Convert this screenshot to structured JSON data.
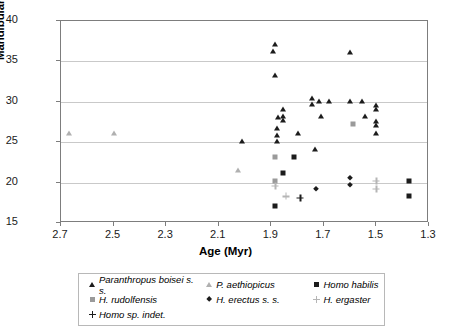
{
  "chart_data": {
    "type": "scatter",
    "title": "",
    "xlabel": "Age (Myr)",
    "ylabel": "Mandibular corpus breadth (mm)",
    "xlim": [
      2.7,
      1.3
    ],
    "ylim": [
      15,
      40
    ],
    "x_reversed": true,
    "xticks": [
      "2.7",
      "2.5",
      "2.3",
      "2.1",
      "1.9",
      "1.7",
      "1.5",
      "1.3"
    ],
    "xtick_values": [
      2.7,
      2.5,
      2.3,
      2.1,
      1.9,
      1.7,
      1.5,
      1.3
    ],
    "yticks": [
      "15",
      "20",
      "25",
      "30",
      "35",
      "40"
    ],
    "ytick_values": [
      15,
      20,
      25,
      30,
      35,
      40
    ],
    "grid": "horizontal",
    "legend_position": "below-plot",
    "series": [
      {
        "name": "Paranthropus boisei s. s.",
        "marker": "triangle",
        "color": "#1c1c1c",
        "points": [
          [
            1.885,
            37.2
          ],
          [
            1.895,
            36.3
          ],
          [
            1.885,
            33.3
          ],
          [
            1.875,
            28.1
          ],
          [
            1.855,
            29.1
          ],
          [
            1.855,
            28.3
          ],
          [
            1.855,
            27.7
          ],
          [
            1.88,
            26.7
          ],
          [
            1.88,
            25.9
          ],
          [
            1.88,
            25.1
          ],
          [
            2.01,
            25.1
          ],
          [
            1.8,
            26.1
          ],
          [
            1.745,
            30.5
          ],
          [
            1.745,
            29.7
          ],
          [
            1.72,
            30.1
          ],
          [
            1.68,
            30.1
          ],
          [
            1.6,
            30.1
          ],
          [
            1.555,
            30.1
          ],
          [
            1.6,
            36.2
          ],
          [
            1.71,
            28.2
          ],
          [
            1.545,
            28.2
          ],
          [
            1.5,
            29.6
          ],
          [
            1.5,
            29.1
          ],
          [
            1.5,
            27.6
          ],
          [
            1.5,
            27.1
          ],
          [
            1.5,
            26.2
          ],
          [
            1.735,
            24.1
          ]
        ]
      },
      {
        "name": "P. aethiopicus",
        "marker": "triangle",
        "color": "#b0b0b0",
        "points": [
          [
            2.67,
            26.1
          ],
          [
            2.5,
            26.2
          ],
          [
            2.025,
            21.6
          ]
        ]
      },
      {
        "name": "Homo habilis",
        "marker": "square",
        "color": "#1c1c1c",
        "points": [
          [
            1.855,
            21.2
          ],
          [
            1.815,
            23.2
          ],
          [
            1.885,
            17.1
          ],
          [
            1.375,
            20.2
          ],
          [
            1.375,
            18.3
          ]
        ]
      },
      {
        "name": "H. rudolfensis",
        "marker": "square",
        "color": "#9a9a9a",
        "points": [
          [
            1.885,
            23.2
          ],
          [
            1.885,
            20.2
          ],
          [
            1.59,
            27.2
          ]
        ]
      },
      {
        "name": "H. erectus s. s.",
        "marker": "diamond",
        "color": "#1c1c1c",
        "points": [
          [
            1.73,
            19.2
          ],
          [
            1.6,
            20.6
          ],
          [
            1.6,
            19.7
          ]
        ]
      },
      {
        "name": "H. ergaster",
        "marker": "plus",
        "color": "#b5b5b5",
        "points": [
          [
            1.885,
            19.6
          ],
          [
            1.5,
            20.2
          ],
          [
            1.5,
            19.2
          ],
          [
            1.845,
            18.3
          ]
        ]
      },
      {
        "name": "Homo sp. indet.",
        "marker": "plus",
        "color": "#1c1c1c",
        "points": [
          [
            1.79,
            18.1
          ]
        ]
      }
    ]
  },
  "legend": {
    "rows": [
      [
        {
          "label": "Paranthropus boisei s. s.",
          "series": 0
        },
        {
          "label": "P. aethiopicus",
          "series": 1
        },
        {
          "label": "Homo habilis",
          "series": 2
        }
      ],
      [
        {
          "label": "H. rudolfensis",
          "series": 3
        },
        {
          "label": "H. erectus s. s.",
          "series": 4
        },
        {
          "label": "H. ergaster",
          "series": 5
        }
      ],
      [
        {
          "label": "Homo sp. indet.",
          "series": 6
        }
      ]
    ]
  }
}
